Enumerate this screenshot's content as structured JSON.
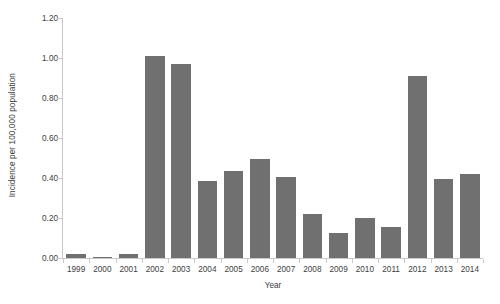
{
  "chart_data": {
    "type": "bar",
    "title": "",
    "subtitle": "",
    "xlabel": "Year",
    "ylabel": "Incidence per 100,000 population",
    "categories": [
      "1999",
      "2000",
      "2001",
      "2002",
      "2003",
      "2004",
      "2005",
      "2006",
      "2007",
      "2008",
      "2009",
      "2010",
      "2011",
      "2012",
      "2013",
      "2014"
    ],
    "values": [
      0.02,
      0.005,
      0.02,
      1.01,
      0.97,
      0.385,
      0.435,
      0.495,
      0.405,
      0.22,
      0.125,
      0.2,
      0.155,
      0.91,
      0.395,
      0.42
    ],
    "series": [
      {
        "name": "Incidence",
        "values": [
          0.02,
          0.005,
          0.02,
          1.01,
          0.97,
          0.385,
          0.435,
          0.495,
          0.405,
          0.22,
          0.125,
          0.2,
          0.155,
          0.91,
          0.395,
          0.42
        ]
      }
    ],
    "ylim": [
      0.0,
      1.2
    ],
    "ytick_values": [
      0.0,
      0.2,
      0.4,
      0.6,
      0.8,
      1.0,
      1.2
    ],
    "ytick_labels": [
      "0.00",
      "0.20",
      "0.40",
      "0.60",
      "0.80",
      "1.00",
      "1.20"
    ],
    "grid": false,
    "legend": false,
    "legend_position": "none",
    "bar_color": "#707070",
    "axis_color": "#c9c9c9",
    "text_color": "#404040",
    "background_color": "#ffffff",
    "annotations": []
  }
}
